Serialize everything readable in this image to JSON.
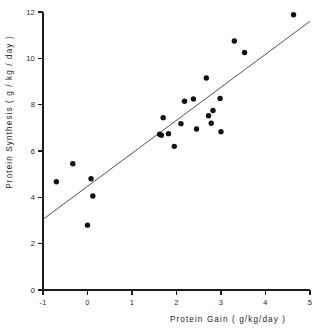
{
  "chart_data": {
    "type": "scatter",
    "title": "",
    "xlabel": "Protein Gain ( g/kg/day )",
    "ylabel": "Protein Synthesis  ( g / kg / day )",
    "xlim": [
      -1,
      5
    ],
    "ylim": [
      0,
      12
    ],
    "xticks": [
      -1,
      0,
      1,
      2,
      3,
      4,
      5
    ],
    "xtick_labels": [
      "-1",
      "0",
      "1",
      "2",
      "3",
      "4",
      "5"
    ],
    "yticks": [
      0,
      2,
      4,
      6,
      8,
      10,
      12
    ],
    "ytick_labels": [
      "0",
      "2",
      "4",
      "6",
      "8",
      "10",
      "12"
    ],
    "grid": false,
    "legend": null,
    "marker": "filled-circle",
    "marker_color": "#111111",
    "points": [
      {
        "x": -0.7,
        "y": 4.67
      },
      {
        "x": -0.33,
        "y": 5.45
      },
      {
        "x": 0.08,
        "y": 4.8
      },
      {
        "x": 0.12,
        "y": 4.06
      },
      {
        "x": 0.0,
        "y": 2.8
      },
      {
        "x": 1.62,
        "y": 6.72
      },
      {
        "x": 1.66,
        "y": 6.68
      },
      {
        "x": 1.7,
        "y": 7.44
      },
      {
        "x": 1.82,
        "y": 6.75
      },
      {
        "x": 1.95,
        "y": 6.2
      },
      {
        "x": 2.1,
        "y": 7.18
      },
      {
        "x": 2.18,
        "y": 8.15
      },
      {
        "x": 2.38,
        "y": 8.25
      },
      {
        "x": 2.45,
        "y": 6.95
      },
      {
        "x": 2.67,
        "y": 9.15
      },
      {
        "x": 2.72,
        "y": 7.52
      },
      {
        "x": 2.78,
        "y": 7.2
      },
      {
        "x": 2.82,
        "y": 7.75
      },
      {
        "x": 2.98,
        "y": 8.27
      },
      {
        "x": 3.0,
        "y": 6.83
      },
      {
        "x": 3.3,
        "y": 10.75
      },
      {
        "x": 3.53,
        "y": 10.25
      },
      {
        "x": 4.63,
        "y": 11.88
      }
    ],
    "fit_line": {
      "type": "linear-regression",
      "x_start": -1,
      "y_start": 3.05,
      "x_end": 5,
      "y_end": 11.6,
      "color": "#3d3d3d"
    }
  }
}
